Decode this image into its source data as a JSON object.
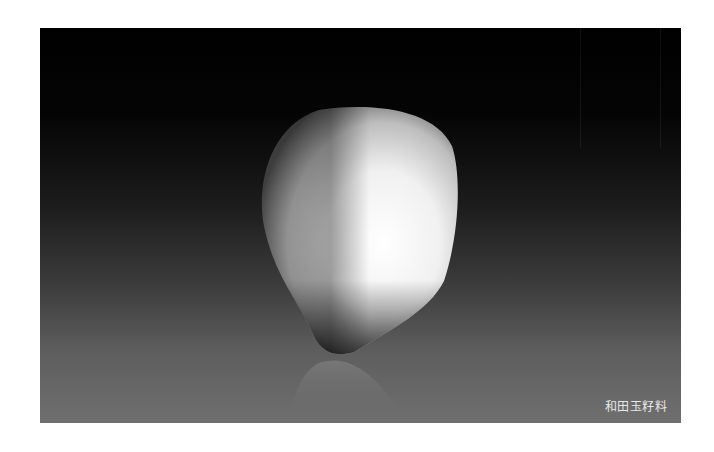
{
  "photo": {
    "subject": "white jade pebble on dark gradient background with reflection",
    "caption": "和田玉籽料",
    "colors": {
      "background_top": "#000000",
      "background_bottom": "#6f6f6f",
      "stone_highlight": "#ffffff",
      "stone_shadow": "#3a3a3a"
    }
  }
}
